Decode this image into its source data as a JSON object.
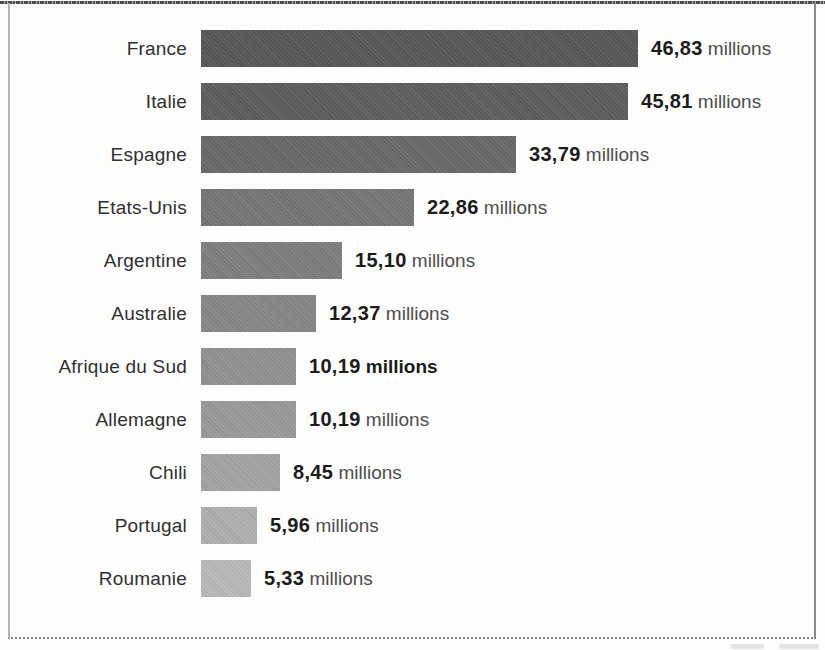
{
  "page": {
    "background_color": "#fdfdfc",
    "frame_border_color": "#8a8a8a",
    "top_edge_line_color": "#4e4e4e"
  },
  "chart_data": {
    "type": "bar",
    "orientation": "horizontal",
    "title": "",
    "xlabel": "",
    "ylabel": "",
    "xlim": [
      0,
      47
    ],
    "grid": false,
    "legend": false,
    "value_format": "french-decimal-comma",
    "unit_label": "millions",
    "categories": [
      "France",
      "Italie",
      "Espagne",
      "Etats-Unis",
      "Argentine",
      "Australie",
      "Afrique du Sud",
      "Allemagne",
      "Chili",
      "Portugal",
      "Roumanie"
    ],
    "values": [
      46.83,
      45.81,
      33.79,
      22.86,
      15.1,
      12.37,
      10.19,
      10.19,
      8.45,
      5.96,
      5.33
    ],
    "value_labels": [
      "46,83",
      "45,81",
      "33,79",
      "22,86",
      "15,10",
      "12,37",
      "10,19",
      "10,19",
      "8,45",
      "5,96",
      "5,33"
    ],
    "bar_colors": [
      "#575757",
      "#5e5e5e",
      "#696969",
      "#757575",
      "#7e7e7e",
      "#878787",
      "#909090",
      "#999999",
      "#a3a3a3",
      "#aeaeae",
      "#b8b8b8"
    ],
    "fully_bold_value_rows": [
      6
    ]
  }
}
